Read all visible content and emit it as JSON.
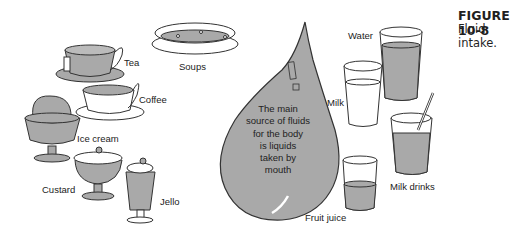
{
  "figure": {
    "number": "FIGURE 10-8",
    "caption": "Fluid intake."
  },
  "center": {
    "text_lines": [
      "The main",
      "source of fluids",
      "for the body",
      "is liquids",
      "taken by",
      "mouth"
    ]
  },
  "items": {
    "tea": "Tea",
    "coffee": "Coffee",
    "soups": "Soups",
    "ice_cream": "Ice cream",
    "custard": "Custard",
    "jello": "Jello",
    "water": "Water",
    "milk": "Milk",
    "milk_drinks": "Milk drinks",
    "fruit_juice": "Fruit juice"
  },
  "colors": {
    "fill_gray": "#a9a9a9",
    "outline": "#333333",
    "white": "#ffffff"
  }
}
